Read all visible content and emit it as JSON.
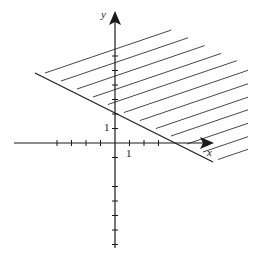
{
  "figure": {
    "colors": {
      "ink": "#1a1a1a",
      "hatch": "#333333",
      "background": "#ffffff"
    }
  },
  "axes": {
    "x_label": "x",
    "y_label": "y",
    "x_unit_label": "1",
    "y_unit_label": "1",
    "origin_px": [
      115,
      143
    ],
    "unit_px": 14.5,
    "x_ticks": [
      -4,
      -3,
      -2,
      -1,
      1,
      2,
      3
    ],
    "y_ticks": [
      -7,
      -6,
      -5,
      -4,
      -3,
      -1,
      1,
      2,
      3,
      4,
      5,
      6
    ]
  },
  "chart_data": {
    "type": "line",
    "title": "",
    "xlabel": "x",
    "ylabel": "y",
    "xlim": [
      -7,
      7
    ],
    "ylim": [
      -7,
      9
    ],
    "grid": false,
    "series": [
      {
        "name": "boundary",
        "equation": "y = -x/2 + 2",
        "x": [
          -5.5,
          6.8
        ],
        "y": [
          4.75,
          -1.4
        ],
        "y_intercept": 2,
        "x_intercept": 4
      }
    ],
    "shaded_region": "above the line (y >= -x/2 + 2)",
    "annotations": [
      "1 (x-axis unit)",
      "1 (y-axis unit)"
    ]
  }
}
